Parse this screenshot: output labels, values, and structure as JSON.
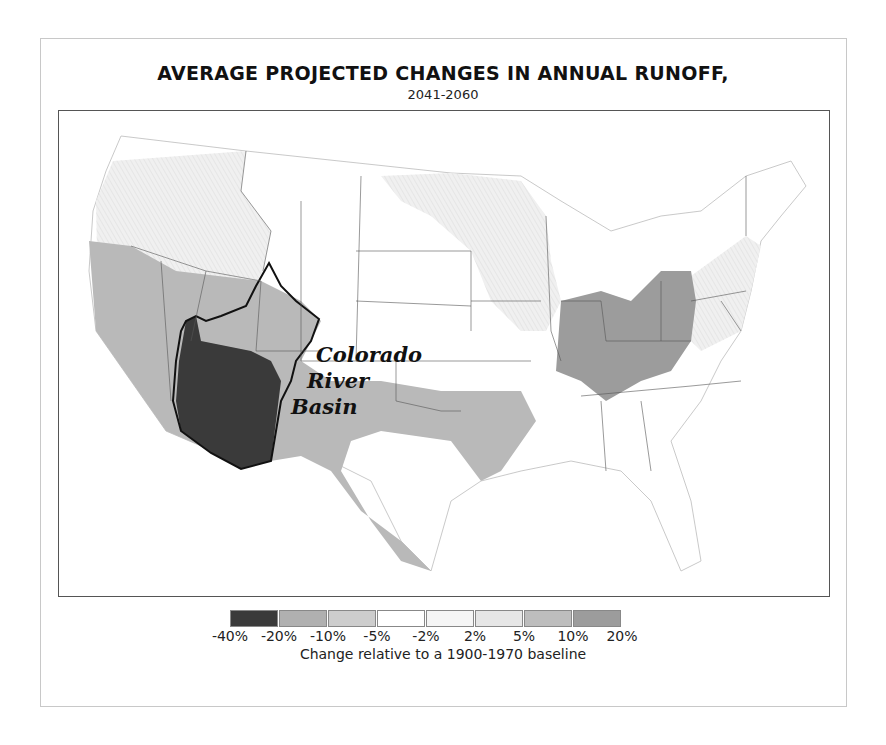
{
  "title": "AVERAGE PROJECTED CHANGES IN ANNUAL RUNOFF,",
  "subtitle": "2041-2060",
  "map": {
    "region": "Contiguous United States",
    "highlight_label": [
      "Colorado",
      "River",
      "Basin"
    ],
    "colors": {
      "-40_to_-20": "#3a3a3a",
      "-20_to_-10": "#b0b0b0",
      "-10_to_-5": "#cdcdcd",
      "-5_to_-2": "#ffffff",
      "-2_to_2": "#f4f4f4",
      "2_to_5": "#e6e6e6",
      "5_to_10": "#bdbdbd",
      "10_to_20": "#9a9a9a"
    }
  },
  "legend": {
    "swatch_colors": [
      "#3a3a3a",
      "#b0b0b0",
      "#cdcdcd",
      "#ffffff",
      "#f5f5f5",
      "#e6e6e6",
      "#bdbdbd",
      "#9c9c9c"
    ],
    "ticks": [
      "-40%",
      "-20%",
      "-10%",
      "-5%",
      "-2%",
      "2%",
      "5%",
      "10%",
      "20%"
    ],
    "caption": "Change relative to a 1900-1970 baseline"
  }
}
